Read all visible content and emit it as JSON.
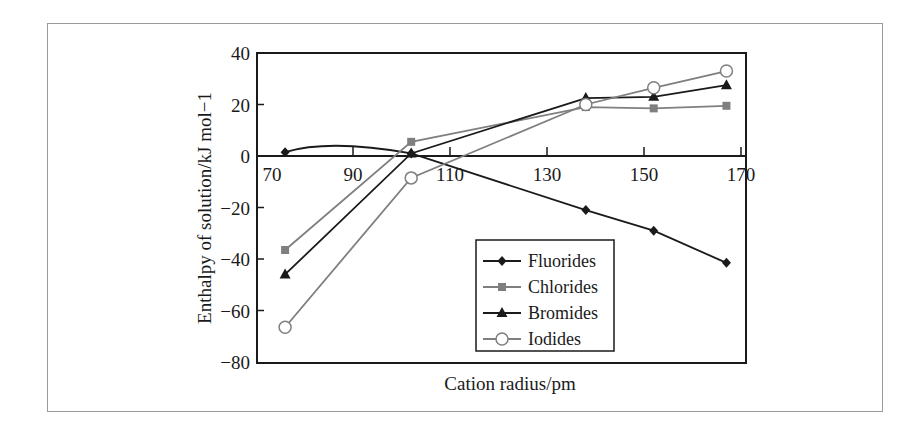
{
  "chart_data": {
    "type": "line",
    "title": "",
    "xlabel": "Cation radius/pm",
    "ylabel": "Enthalpy of solution/kJ mol−1",
    "xlim": [
      70,
      171
    ],
    "ylim": [
      -80,
      40
    ],
    "x_ticks": [
      70,
      90,
      110,
      130,
      150,
      170
    ],
    "y_ticks": [
      40,
      20,
      0,
      -20,
      -40,
      -60,
      -80
    ],
    "x_tick_labels": [
      "70",
      "90",
      "110",
      "130",
      "150",
      "170"
    ],
    "y_tick_labels": [
      "40",
      "20",
      "0",
      "−20",
      "−40",
      "−60",
      "−80"
    ],
    "x_axis_position": "y=0",
    "grid": false,
    "legend_position": "lower right (inside)",
    "x": [
      76,
      102,
      138,
      152,
      167
    ],
    "series": [
      {
        "name": "Fluorides",
        "marker": "diamond",
        "color": "#1a1a1a",
        "smooth_first_segment": true,
        "values": [
          1.5,
          1,
          -21,
          -29,
          -41.5
        ]
      },
      {
        "name": "Chlorides",
        "marker": "square",
        "color": "#7f7f7f",
        "values": [
          -36.5,
          5.5,
          19,
          18.5,
          19.5
        ]
      },
      {
        "name": "Bromides",
        "marker": "triangle",
        "color": "#1a1a1a",
        "values": [
          -46,
          1,
          22.5,
          23,
          27.5
        ]
      },
      {
        "name": "Iodides",
        "marker": "open-circle",
        "color": "#7f7f7f",
        "values": [
          -66.5,
          -8.5,
          20,
          26.5,
          33
        ]
      }
    ]
  },
  "legend": {
    "items": [
      "Fluorides",
      "Chlorides",
      "Bromides",
      "Iodides"
    ]
  },
  "axes": {
    "x_title": "Cation radius/pm",
    "y_title": "Enthalpy of solution/kJ mol−1"
  }
}
